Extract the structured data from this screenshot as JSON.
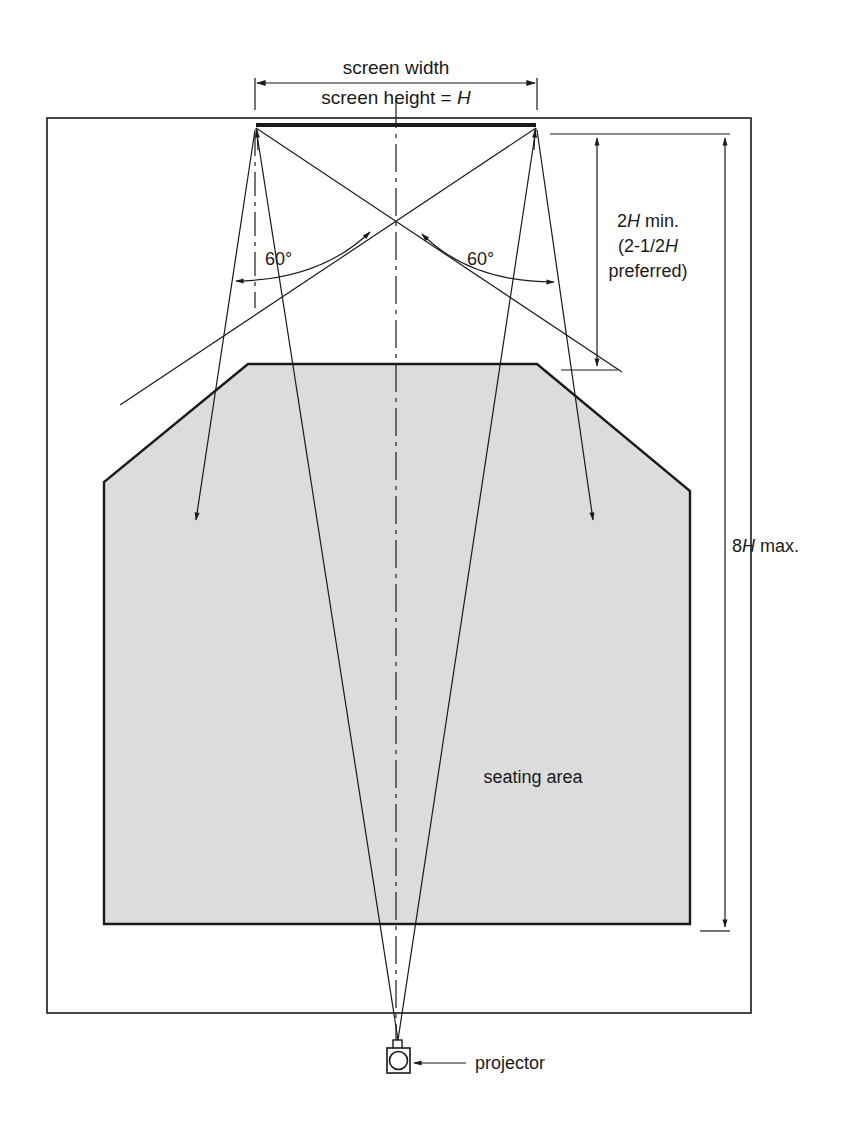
{
  "diagram": {
    "type": "projection-room-layout",
    "labels": {
      "screen_width": "screen width",
      "screen_height_prefix": "screen height = ",
      "screen_height_var": "H",
      "angle_left": "60°",
      "angle_right": "60°",
      "min_distance_num": "2",
      "min_distance_var": "H",
      "min_distance_suffix": " min.",
      "preferred_line1_prefix": "(2-1/2",
      "preferred_line1_var": "H",
      "preferred_line2": "preferred)",
      "max_distance_num": "8",
      "max_distance_var": "H",
      "max_distance_suffix": " max.",
      "seating_area": "seating area",
      "projector": "projector"
    },
    "colors": {
      "line": "#1a1a1a",
      "seating_fill": "#dcdcdc",
      "background": "#ffffff"
    }
  }
}
